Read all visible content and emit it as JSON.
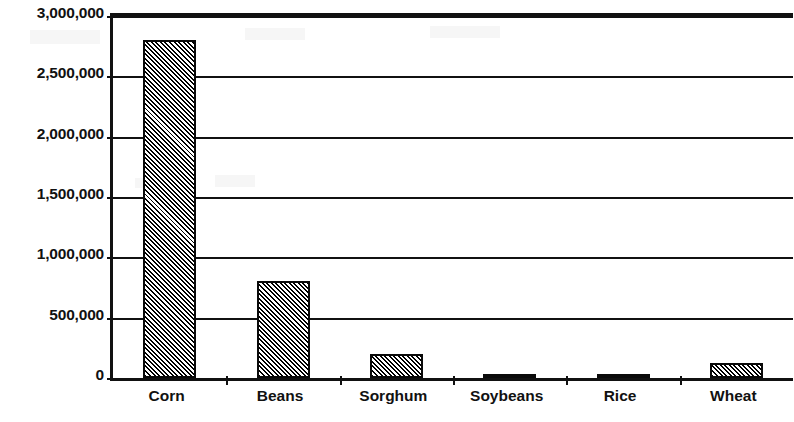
{
  "chart_data": {
    "type": "bar",
    "title": "",
    "subtitle": "",
    "xlabel": "",
    "ylabel": "",
    "categories": [
      "Corn",
      "Beans",
      "Sorghum",
      "Soybeans",
      "Rice",
      "Wheat"
    ],
    "values": [
      2800000,
      800000,
      200000,
      30000,
      30000,
      125000
    ],
    "series": [
      {
        "name": "",
        "values": [
          2800000,
          800000,
          200000,
          30000,
          30000,
          125000
        ]
      }
    ],
    "ylim": [
      0,
      3000000
    ],
    "ytick_values": [
      0,
      500000,
      1000000,
      1500000,
      2000000,
      2500000,
      3000000
    ],
    "ytick_labels": [
      "0",
      "500,000",
      "1,000,000",
      "1,500,000",
      "2,000,000",
      "2,500,000",
      "3,000,000"
    ],
    "grid": true,
    "grid_axis": "y",
    "legend": false,
    "legend_position": "none",
    "bar_fill": "diagonal-hatch",
    "bar_fill_color": "#000000",
    "bar_edge_color": "#000000",
    "background_color": "#ffffff",
    "axis_color": "#111111"
  }
}
